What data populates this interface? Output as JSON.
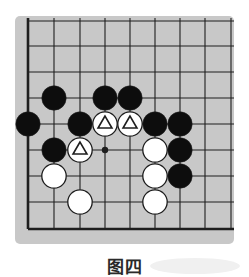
{
  "diagram": {
    "type": "go-board-fragment",
    "caption": "图四",
    "colors": {
      "board": "#c8c8c8",
      "line": "#1e1e1e",
      "black_stone": "#0d0d0d",
      "white_stone": "#ffffff",
      "background": "#ffffff"
    },
    "grid": {
      "x_lines": [
        28,
        54,
        80,
        105,
        130,
        155,
        180,
        205,
        231
      ],
      "y_lines": [
        21,
        46,
        72,
        98,
        124,
        150,
        176,
        202,
        229
      ],
      "thick_edges": [
        "left",
        "bottom"
      ]
    },
    "star_points": [
      {
        "col": 3,
        "row": 5
      }
    ],
    "stones": [
      {
        "color": "black",
        "col": 1,
        "row": 3
      },
      {
        "color": "black",
        "col": 3,
        "row": 3
      },
      {
        "color": "black",
        "col": 4,
        "row": 3
      },
      {
        "color": "black",
        "col": 0,
        "row": 4
      },
      {
        "color": "black",
        "col": 2,
        "row": 4
      },
      {
        "color": "white",
        "col": 3,
        "row": 4,
        "mark": "triangle"
      },
      {
        "color": "white",
        "col": 4,
        "row": 4,
        "mark": "triangle"
      },
      {
        "color": "black",
        "col": 5,
        "row": 4
      },
      {
        "color": "black",
        "col": 6,
        "row": 4
      },
      {
        "color": "black",
        "col": 1,
        "row": 5
      },
      {
        "color": "white",
        "col": 2,
        "row": 5,
        "mark": "triangle"
      },
      {
        "color": "white",
        "col": 5,
        "row": 5
      },
      {
        "color": "black",
        "col": 6,
        "row": 5
      },
      {
        "color": "white",
        "col": 1,
        "row": 6
      },
      {
        "color": "white",
        "col": 5,
        "row": 6
      },
      {
        "color": "black",
        "col": 6,
        "row": 6
      },
      {
        "color": "white",
        "col": 2,
        "row": 7
      },
      {
        "color": "white",
        "col": 5,
        "row": 7
      }
    ]
  }
}
